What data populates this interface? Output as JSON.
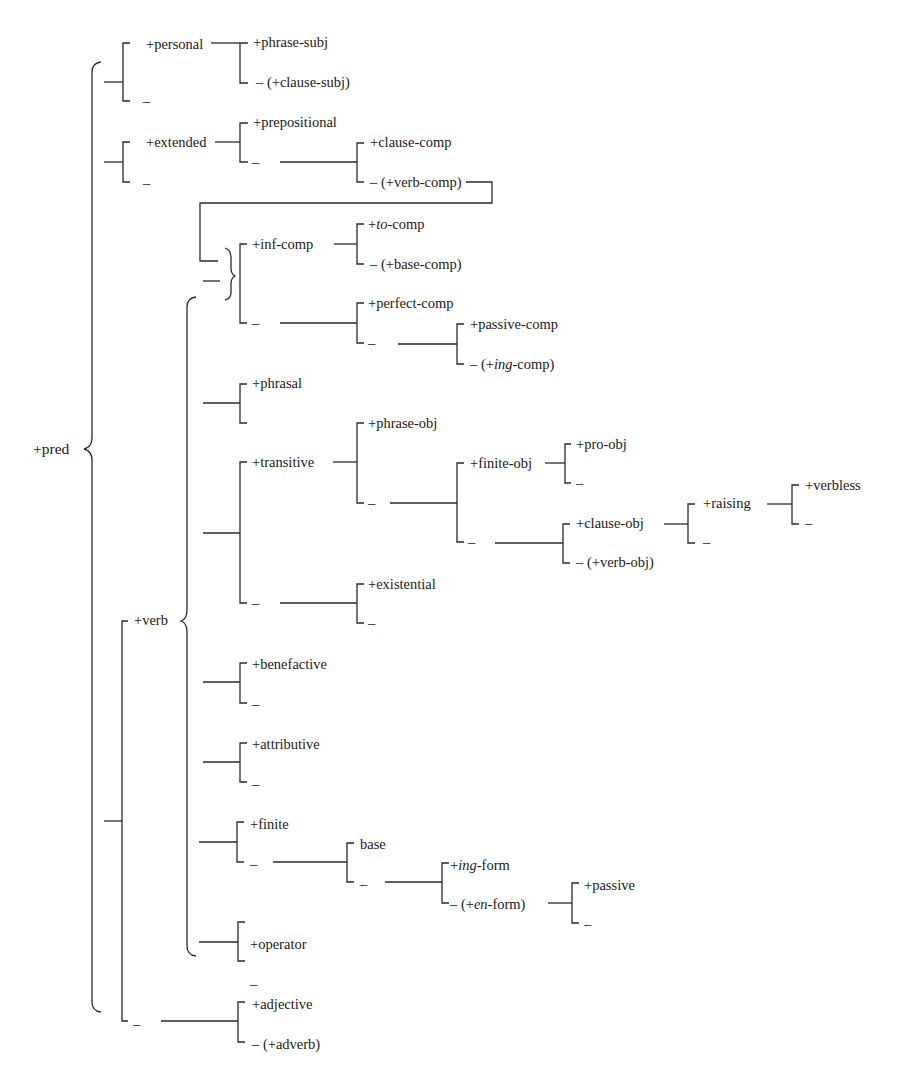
{
  "diagram": {
    "root": {
      "label": "+pred",
      "x": 33,
      "y": 441
    },
    "nodes": [
      {
        "id": "personal",
        "label": "+personal",
        "x": 146,
        "y": 36
      },
      {
        "id": "personal-minus",
        "label": "–",
        "x": 143,
        "y": 93
      },
      {
        "id": "phrase-subj",
        "label": "+phrase-subj",
        "x": 253,
        "y": 34
      },
      {
        "id": "clause-subj",
        "label": "– (+clause-subj)",
        "x": 256,
        "y": 74
      },
      {
        "id": "extended",
        "label": "+extended",
        "x": 146,
        "y": 134
      },
      {
        "id": "extended-minus",
        "label": "–",
        "x": 143,
        "y": 175
      },
      {
        "id": "prepositional",
        "label": "+prepositional",
        "x": 253,
        "y": 114
      },
      {
        "id": "prep-minus",
        "label": "–",
        "x": 252,
        "y": 154
      },
      {
        "id": "clause-comp",
        "label": "+clause-comp",
        "x": 370,
        "y": 134
      },
      {
        "id": "verb-comp",
        "label": "– (+verb-comp)",
        "x": 370,
        "y": 174
      },
      {
        "id": "inf-comp",
        "label": "+inf-comp",
        "x": 252,
        "y": 236
      },
      {
        "id": "to-comp",
        "label": "+<i>to</i>-comp",
        "x": 368,
        "y": 216
      },
      {
        "id": "base-comp",
        "label": "– (+base-comp)",
        "x": 370,
        "y": 256
      },
      {
        "id": "inf-minus",
        "label": "–",
        "x": 252,
        "y": 315
      },
      {
        "id": "perfect-comp",
        "label": "+perfect-comp",
        "x": 368,
        "y": 295
      },
      {
        "id": "perfect-minus",
        "label": "–",
        "x": 368,
        "y": 335
      },
      {
        "id": "passive-comp",
        "label": "+passive-comp",
        "x": 470,
        "y": 316
      },
      {
        "id": "ing-comp",
        "label": "– (+<i>ing</i>-comp)",
        "x": 470,
        "y": 356
      },
      {
        "id": "phrasal",
        "label": "+phrasal",
        "x": 252,
        "y": 375
      },
      {
        "id": "transitive",
        "label": "+transitive",
        "x": 252,
        "y": 454
      },
      {
        "id": "phrase-obj",
        "label": "+phrase-obj",
        "x": 368,
        "y": 415
      },
      {
        "id": "trans-mid-minus",
        "label": "–",
        "x": 368,
        "y": 495
      },
      {
        "id": "finite-obj",
        "label": "+finite-obj",
        "x": 470,
        "y": 455
      },
      {
        "id": "pro-obj",
        "label": "+pro-obj",
        "x": 576,
        "y": 436
      },
      {
        "id": "pro-minus",
        "label": "–",
        "x": 576,
        "y": 475
      },
      {
        "id": "finite-minus",
        "label": "–",
        "x": 468,
        "y": 534
      },
      {
        "id": "clause-obj",
        "label": "+clause-obj",
        "x": 576,
        "y": 515
      },
      {
        "id": "verb-obj",
        "label": "– (+verb-obj)",
        "x": 576,
        "y": 554
      },
      {
        "id": "raising",
        "label": "+raising",
        "x": 703,
        "y": 495
      },
      {
        "id": "raising-minus",
        "label": "–",
        "x": 703,
        "y": 534
      },
      {
        "id": "verbless",
        "label": "+verbless",
        "x": 805,
        "y": 477
      },
      {
        "id": "verbless-minus",
        "label": "–",
        "x": 805,
        "y": 515
      },
      {
        "id": "trans-minus",
        "label": "–",
        "x": 252,
        "y": 595
      },
      {
        "id": "existential",
        "label": "+existential",
        "x": 368,
        "y": 576
      },
      {
        "id": "exist-minus",
        "label": "–",
        "x": 368,
        "y": 615
      },
      {
        "id": "verb",
        "label": "+verb",
        "x": 134,
        "y": 612
      },
      {
        "id": "benefactive",
        "label": "+benefactive",
        "x": 252,
        "y": 656
      },
      {
        "id": "bene-minus",
        "label": "–",
        "x": 252,
        "y": 696
      },
      {
        "id": "attributive",
        "label": "+attributive",
        "x": 252,
        "y": 736
      },
      {
        "id": "attr-minus",
        "label": "–",
        "x": 252,
        "y": 776
      },
      {
        "id": "finite",
        "label": "+finite",
        "x": 250,
        "y": 816
      },
      {
        "id": "finite-verb-minus",
        "label": "–",
        "x": 250,
        "y": 856
      },
      {
        "id": "base",
        "label": "base",
        "x": 360,
        "y": 836
      },
      {
        "id": "base-minus",
        "label": "–",
        "x": 360,
        "y": 876
      },
      {
        "id": "ing-form",
        "label": "+<i>ing</i>-form",
        "x": 450,
        "y": 857
      },
      {
        "id": "en-form",
        "label": "– (+<i>en</i>-form)",
        "x": 450,
        "y": 896
      },
      {
        "id": "passive",
        "label": "+passive",
        "x": 584,
        "y": 877
      },
      {
        "id": "passive-minus",
        "label": "–",
        "x": 584,
        "y": 916
      },
      {
        "id": "operator",
        "label": "+operator",
        "x": 250,
        "y": 936
      },
      {
        "id": "operator-minus",
        "label": "–",
        "x": 250,
        "y": 976
      },
      {
        "id": "pred-minus",
        "label": "–",
        "x": 133,
        "y": 1016
      },
      {
        "id": "adjective",
        "label": "+adjective",
        "x": 252,
        "y": 996
      },
      {
        "id": "adverb",
        "label": "– (+adverb)",
        "x": 252,
        "y": 1036
      }
    ]
  }
}
